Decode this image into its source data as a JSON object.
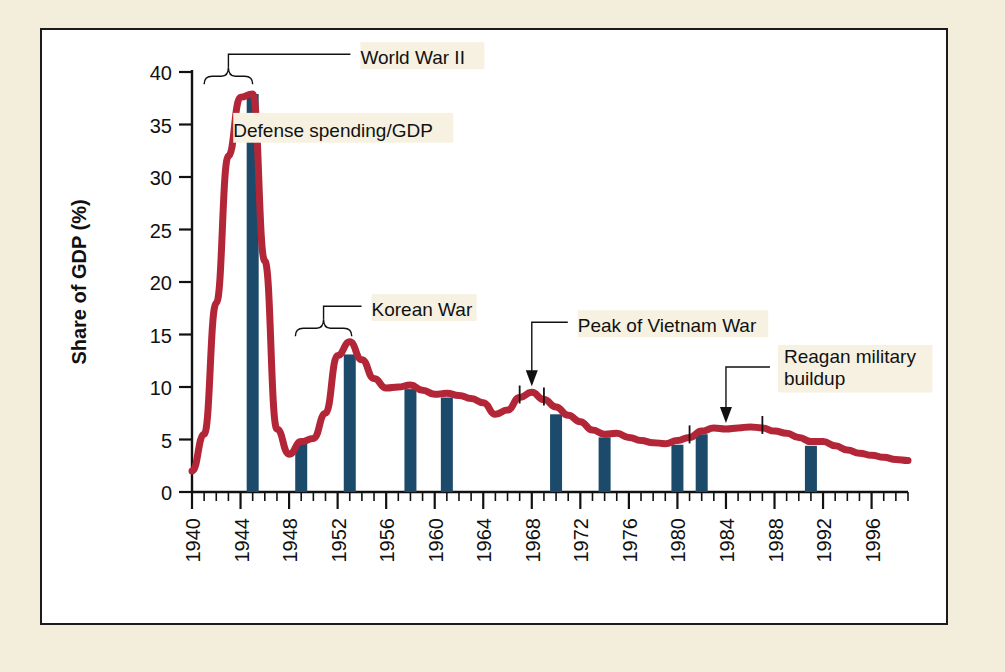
{
  "figure": {
    "background_color": "#f3eddc",
    "panel_color": "#ffffff",
    "border_color": "#1b1b1b"
  },
  "chart_data": {
    "type": "line",
    "title": "",
    "xlabel": "Year",
    "ylabel": "Share of GDP (%)",
    "xlim": [
      1940,
      1999
    ],
    "ylim": [
      0,
      40
    ],
    "grid": false,
    "legend_position": "none",
    "line_color": "#b32638",
    "bar_color": "#1b4a6b",
    "y_ticks": [
      0,
      5,
      10,
      15,
      20,
      25,
      30,
      35,
      40
    ],
    "x_ticks": [
      1940,
      1944,
      1948,
      1952,
      1956,
      1960,
      1964,
      1968,
      1972,
      1976,
      1980,
      1984,
      1988,
      1992,
      1996
    ],
    "x_minor_tick_interval": 1,
    "series": [
      {
        "name": "Defense spending/GDP",
        "x": [
          1940,
          1941,
          1942,
          1943,
          1944,
          1945,
          1946,
          1947,
          1948,
          1949,
          1950,
          1951,
          1952,
          1953,
          1954,
          1955,
          1956,
          1957,
          1958,
          1959,
          1960,
          1961,
          1962,
          1963,
          1964,
          1965,
          1966,
          1967,
          1968,
          1969,
          1970,
          1971,
          1972,
          1973,
          1974,
          1975,
          1976,
          1977,
          1978,
          1979,
          1980,
          1981,
          1982,
          1983,
          1984,
          1985,
          1986,
          1987,
          1988,
          1989,
          1990,
          1991,
          1992,
          1993,
          1994,
          1995,
          1996,
          1997,
          1998,
          1999
        ],
        "values": [
          2.0,
          5.5,
          18.0,
          32.0,
          37.6,
          37.9,
          22.0,
          6.0,
          3.6,
          4.8,
          5.1,
          7.5,
          13.0,
          14.3,
          12.6,
          10.8,
          9.9,
          10.0,
          10.2,
          9.7,
          9.3,
          9.4,
          9.2,
          8.9,
          8.5,
          7.4,
          7.8,
          9.0,
          9.5,
          8.8,
          8.1,
          7.3,
          6.7,
          5.9,
          5.5,
          5.6,
          5.2,
          4.9,
          4.7,
          4.6,
          4.9,
          5.2,
          5.8,
          6.1,
          6.0,
          6.1,
          6.2,
          6.1,
          5.8,
          5.6,
          5.2,
          4.8,
          4.8,
          4.4,
          4.0,
          3.7,
          3.5,
          3.3,
          3.1,
          3.0
        ]
      }
    ],
    "bars": [
      {
        "year": 1945,
        "value": 37.9
      },
      {
        "year": 1949,
        "value": 4.7
      },
      {
        "year": 1953,
        "value": 13.1
      },
      {
        "year": 1958,
        "value": 9.8
      },
      {
        "year": 1961,
        "value": 9.0
      },
      {
        "year": 1970,
        "value": 7.4
      },
      {
        "year": 1974,
        "value": 5.2
      },
      {
        "year": 1980,
        "value": 4.5
      },
      {
        "year": 1982,
        "value": 5.5
      },
      {
        "year": 1991,
        "value": 4.4
      }
    ],
    "annotations": [
      {
        "id": "world-war-2",
        "label": "World War II",
        "kind": "bracket",
        "span_years": [
          1941,
          1945
        ]
      },
      {
        "id": "defense-spending",
        "label": "Defense spending/GDP",
        "kind": "text"
      },
      {
        "id": "korean-war",
        "label": "Korean War",
        "kind": "bracket",
        "span_years": [
          1950,
          1953
        ]
      },
      {
        "id": "peak-of-vietnam-war",
        "label": "Peak of Vietnam War",
        "kind": "arrow",
        "year": 1968,
        "value": 9.5
      },
      {
        "id": "reagan-military-buildup",
        "label": "Reagan military buildup",
        "label_line_1": "Reagan military",
        "label_line_2": "buildup",
        "kind": "arrow",
        "year": 1984,
        "value": 6.0
      }
    ],
    "marks": [
      {
        "year": 1967,
        "value": 9.0,
        "kind": "tick"
      },
      {
        "year": 1969,
        "value": 8.8,
        "kind": "tick"
      },
      {
        "year": 1981,
        "value": 5.2,
        "kind": "tick"
      },
      {
        "year": 1987,
        "value": 6.1,
        "kind": "tick"
      }
    ]
  }
}
